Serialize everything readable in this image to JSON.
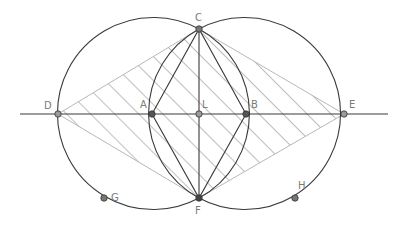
{
  "diagram": {
    "points": [
      {
        "id": "D",
        "label": "D"
      },
      {
        "id": "A",
        "label": "A"
      },
      {
        "id": "L",
        "label": "L"
      },
      {
        "id": "B",
        "label": "B"
      },
      {
        "id": "E",
        "label": "E"
      },
      {
        "id": "C",
        "label": "C"
      },
      {
        "id": "F",
        "label": "F"
      },
      {
        "id": "G",
        "label": "G"
      },
      {
        "id": "H",
        "label": "H"
      }
    ],
    "colors": {
      "line": "#3a3a3a",
      "light_line": "#b0b0b0",
      "hatch": "#8a8a8a",
      "point_fill": "#555555",
      "label": "#7a7a7a"
    }
  }
}
